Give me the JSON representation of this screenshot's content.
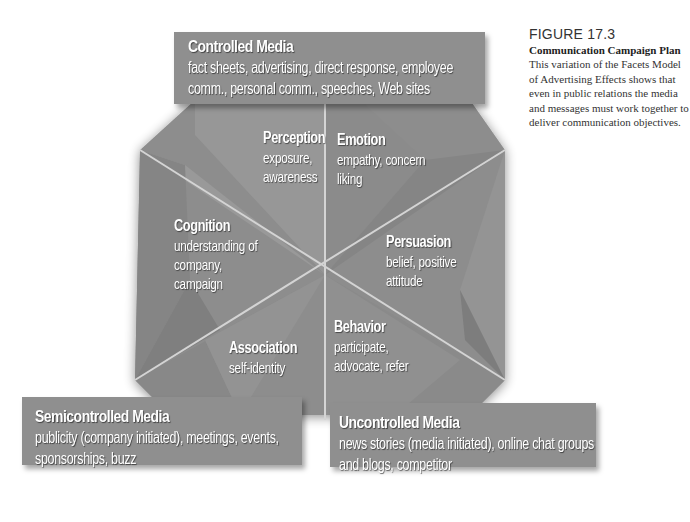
{
  "figure": {
    "label": "FIGURE 17.3",
    "title": "Communication Campaign Plan",
    "caption": "This variation of the Facets Model of Advertising Effects shows that even in public relations the media and messages must work together to deliver communication objectives."
  },
  "media": {
    "controlled": {
      "title": "Controlled Media",
      "line1": "fact sheets, advertising, direct response, employee",
      "line2": "comm., personal comm., speeches, Web sites"
    },
    "semicontrolled": {
      "title": "Semicontrolled Media",
      "line1": "publicity (company initiated), meetings, events,",
      "line2": "sponsorships, buzz"
    },
    "uncontrolled": {
      "title": "Uncontrolled Media",
      "line1": "news stories (media initiated), online chat groups",
      "line2": "and blogs, competitor"
    }
  },
  "facets": {
    "perception": {
      "title": "Perception",
      "line1": "exposure,",
      "line2": "awareness"
    },
    "emotion": {
      "title": "Emotion",
      "line1": "empathy, concern",
      "line2": "liking"
    },
    "cognition": {
      "title": "Cognition",
      "line1": "understanding of",
      "line2": "company,",
      "line3": "campaign"
    },
    "persuasion": {
      "title": "Persuasion",
      "line1": "belief, positive",
      "line2": "attitude"
    },
    "association": {
      "title": "Association",
      "line1": "self-identity"
    },
    "behavior": {
      "title": "Behavior",
      "line1": "participate,",
      "line2": "advocate, refer"
    }
  },
  "colors": {
    "panel": "#8f8f8f",
    "panel_dark": "#7e7e7e",
    "panel_light": "#a3a3a3",
    "divider": "#d6d6d6",
    "text": "#ffffff"
  }
}
